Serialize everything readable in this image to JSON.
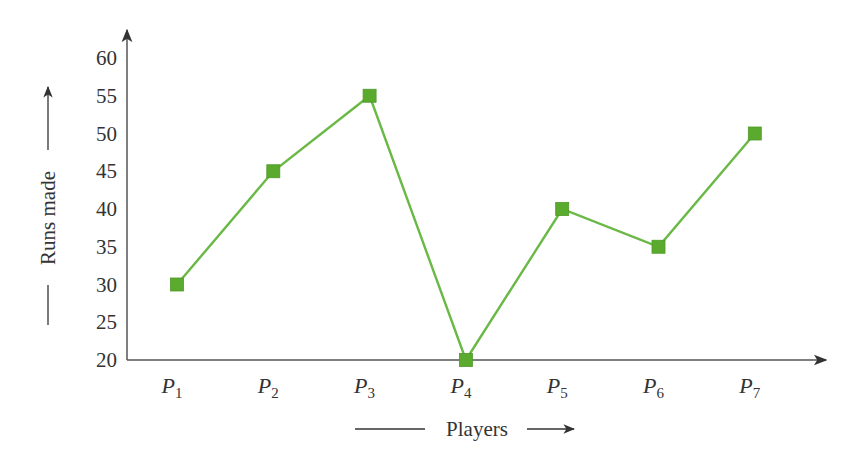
{
  "chart_data": {
    "type": "line",
    "title": "",
    "xlabel": "Players",
    "ylabel": "Runs made",
    "categories": [
      "P1",
      "P2",
      "P3",
      "P4",
      "P5",
      "P6",
      "P7"
    ],
    "category_labels": [
      {
        "main": "P",
        "sub": "1"
      },
      {
        "main": "P",
        "sub": "2"
      },
      {
        "main": "P",
        "sub": "3"
      },
      {
        "main": "P",
        "sub": "4"
      },
      {
        "main": "P",
        "sub": "5"
      },
      {
        "main": "P",
        "sub": "6"
      },
      {
        "main": "P",
        "sub": "7"
      }
    ],
    "series": [
      {
        "name": "Runs made",
        "values": [
          30,
          45,
          55,
          20,
          40,
          35,
          50
        ]
      }
    ],
    "yticks": [
      20,
      25,
      30,
      35,
      40,
      45,
      50,
      55,
      60
    ],
    "ylim": [
      20,
      60
    ],
    "grid": false,
    "legend": null,
    "marker": "square",
    "colors": {
      "line": "#6ab845",
      "marker": "#5aaa2e",
      "axis": "#444444"
    }
  }
}
